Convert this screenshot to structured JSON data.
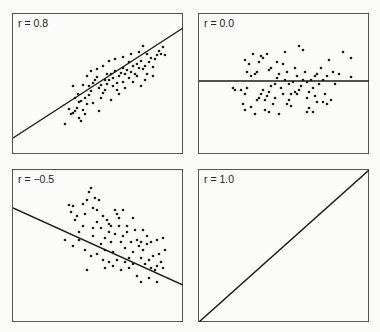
{
  "chart_data": [
    {
      "type": "scatter",
      "title": "r = 0.8",
      "r": 0.8,
      "regression_line": {
        "x1": 0,
        "y1": 124,
        "x2": 170,
        "y2": 14
      },
      "panel": {
        "x": 12,
        "y": 13,
        "w": 170,
        "h": 140
      },
      "points": [
        [
          52,
          110
        ],
        [
          56,
          95
        ],
        [
          58,
          100
        ],
        [
          60,
          99
        ],
        [
          62,
          97
        ],
        [
          64,
          94
        ],
        [
          66,
          104
        ],
        [
          68,
          107
        ],
        [
          70,
          96
        ],
        [
          62,
          84
        ],
        [
          65,
          80
        ],
        [
          68,
          87
        ],
        [
          70,
          71
        ],
        [
          72,
          84
        ],
        [
          74,
          90
        ],
        [
          76,
          72
        ],
        [
          78,
          77
        ],
        [
          80,
          69
        ],
        [
          82,
          66
        ],
        [
          84,
          63
        ],
        [
          86,
          74
        ],
        [
          88,
          71
        ],
        [
          90,
          79
        ],
        [
          92,
          76
        ],
        [
          94,
          70
        ],
        [
          96,
          66
        ],
        [
          98,
          60
        ],
        [
          100,
          64
        ],
        [
          102,
          57
        ],
        [
          104,
          69
        ],
        [
          106,
          62
        ],
        [
          108,
          59
        ],
        [
          110,
          54
        ],
        [
          112,
          60
        ],
        [
          114,
          56
        ],
        [
          116,
          64
        ],
        [
          118,
          58
        ],
        [
          120,
          52
        ],
        [
          122,
          60
        ],
        [
          124,
          50
        ],
        [
          126,
          54
        ],
        [
          128,
          47
        ],
        [
          130,
          55
        ],
        [
          132,
          52
        ],
        [
          134,
          60
        ],
        [
          136,
          48
        ],
        [
          138,
          44
        ],
        [
          140,
          53
        ],
        [
          142,
          45
        ],
        [
          144,
          41
        ],
        [
          146,
          37
        ],
        [
          148,
          40
        ],
        [
          150,
          33
        ],
        [
          152,
          41
        ],
        [
          126,
          38
        ],
        [
          130,
          32
        ],
        [
          134,
          40
        ],
        [
          118,
          40
        ],
        [
          110,
          43
        ],
        [
          102,
          45
        ],
        [
          96,
          47
        ],
        [
          90,
          52
        ],
        [
          84,
          55
        ],
        [
          78,
          57
        ],
        [
          74,
          62
        ],
        [
          92,
          66
        ],
        [
          100,
          72
        ],
        [
          106,
          80
        ],
        [
          112,
          74
        ],
        [
          120,
          68
        ],
        [
          88,
          84
        ],
        [
          80,
          89
        ],
        [
          86,
          97
        ],
        [
          76,
          81
        ],
        [
          60,
          72
        ],
        [
          94,
          60
        ],
        [
          116,
          48
        ],
        [
          124,
          62
        ],
        [
          132,
          66
        ],
        [
          140,
          62
        ],
        [
          98,
          86
        ],
        [
          104,
          76
        ],
        [
          72,
          100
        ],
        [
          66,
          88
        ],
        [
          110,
          68
        ],
        [
          128,
          72
        ]
      ]
    },
    {
      "type": "scatter",
      "title": "r = 0.0",
      "r": 0.0,
      "regression_line": {
        "x1": 0,
        "y1": 67,
        "x2": 170,
        "y2": 67
      },
      "panel": {
        "x": 198,
        "y": 13,
        "w": 170,
        "h": 140
      },
      "points": [
        [
          34,
          74
        ],
        [
          36,
          76
        ],
        [
          42,
          76
        ],
        [
          46,
          80
        ],
        [
          48,
          74
        ],
        [
          44,
          90
        ],
        [
          46,
          96
        ],
        [
          52,
          93
        ],
        [
          56,
          100
        ],
        [
          58,
          86
        ],
        [
          60,
          84
        ],
        [
          62,
          80
        ],
        [
          64,
          76
        ],
        [
          66,
          86
        ],
        [
          68,
          82
        ],
        [
          70,
          78
        ],
        [
          72,
          72
        ],
        [
          74,
          90
        ],
        [
          76,
          70
        ],
        [
          78,
          64
        ],
        [
          80,
          60
        ],
        [
          82,
          74
        ],
        [
          84,
          80
        ],
        [
          86,
          66
        ],
        [
          88,
          58
        ],
        [
          90,
          86
        ],
        [
          92,
          92
        ],
        [
          94,
          68
        ],
        [
          96,
          54
        ],
        [
          98,
          62
        ],
        [
          100,
          76
        ],
        [
          102,
          72
        ],
        [
          104,
          66
        ],
        [
          106,
          58
        ],
        [
          108,
          84
        ],
        [
          110,
          78
        ],
        [
          112,
          66
        ],
        [
          114,
          74
        ],
        [
          116,
          82
        ],
        [
          118,
          60
        ],
        [
          120,
          70
        ],
        [
          122,
          54
        ],
        [
          124,
          66
        ],
        [
          126,
          80
        ],
        [
          128,
          62
        ],
        [
          130,
          46
        ],
        [
          132,
          86
        ],
        [
          134,
          58
        ],
        [
          136,
          70
        ],
        [
          140,
          60
        ],
        [
          144,
          38
        ],
        [
          152,
          44
        ],
        [
          152,
          63
        ],
        [
          100,
          32
        ],
        [
          104,
          36
        ],
        [
          86,
          38
        ],
        [
          84,
          50
        ],
        [
          78,
          48
        ],
        [
          72,
          54
        ],
        [
          68,
          40
        ],
        [
          64,
          44
        ],
        [
          60,
          48
        ],
        [
          58,
          58
        ],
        [
          56,
          60
        ],
        [
          52,
          62
        ],
        [
          48,
          58
        ],
        [
          50,
          50
        ],
        [
          46,
          46
        ],
        [
          54,
          40
        ],
        [
          62,
          42
        ],
        [
          70,
          56
        ],
        [
          88,
          90
        ],
        [
          92,
          80
        ],
        [
          96,
          78
        ],
        [
          108,
          98
        ],
        [
          110,
          94
        ],
        [
          114,
          98
        ],
        [
          80,
          100
        ],
        [
          70,
          98
        ],
        [
          66,
          96
        ],
        [
          118,
          88
        ],
        [
          124,
          88
        ],
        [
          128,
          90
        ],
        [
          108,
          68
        ],
        [
          116,
          62
        ],
        [
          90,
          70
        ],
        [
          98,
          80
        ],
        [
          76,
          84
        ]
      ]
    },
    {
      "type": "scatter",
      "title": "r = −0.5",
      "r": -0.5,
      "regression_line": {
        "x1": 0,
        "y1": 38,
        "x2": 170,
        "y2": 115
      },
      "panel": {
        "x": 12,
        "y": 169,
        "w": 170,
        "h": 152
      },
      "points": [
        [
          56,
          35
        ],
        [
          58,
          42
        ],
        [
          60,
          36
        ],
        [
          62,
          50
        ],
        [
          64,
          46
        ],
        [
          66,
          62
        ],
        [
          70,
          34
        ],
        [
          72,
          44
        ],
        [
          74,
          30
        ],
        [
          76,
          22
        ],
        [
          78,
          18
        ],
        [
          80,
          38
        ],
        [
          82,
          28
        ],
        [
          84,
          40
        ],
        [
          86,
          30
        ],
        [
          88,
          58
        ],
        [
          90,
          46
        ],
        [
          92,
          68
        ],
        [
          94,
          50
        ],
        [
          96,
          62
        ],
        [
          98,
          72
        ],
        [
          100,
          82
        ],
        [
          102,
          64
        ],
        [
          104,
          44
        ],
        [
          106,
          48
        ],
        [
          108,
          72
        ],
        [
          110,
          66
        ],
        [
          112,
          78
        ],
        [
          114,
          62
        ],
        [
          116,
          88
        ],
        [
          118,
          72
        ],
        [
          120,
          82
        ],
        [
          122,
          60
        ],
        [
          124,
          70
        ],
        [
          126,
          76
        ],
        [
          128,
          88
        ],
        [
          130,
          80
        ],
        [
          132,
          94
        ],
        [
          134,
          74
        ],
        [
          136,
          90
        ],
        [
          138,
          98
        ],
        [
          140,
          86
        ],
        [
          142,
          100
        ],
        [
          144,
          96
        ],
        [
          146,
          84
        ],
        [
          148,
          92
        ],
        [
          150,
          98
        ],
        [
          152,
          80
        ],
        [
          124,
          106
        ],
        [
          128,
          112
        ],
        [
          136,
          108
        ],
        [
          144,
          112
        ],
        [
          116,
          98
        ],
        [
          112,
          92
        ],
        [
          104,
          90
        ],
        [
          96,
          92
        ],
        [
          90,
          90
        ],
        [
          84,
          84
        ],
        [
          78,
          86
        ],
        [
          72,
          80
        ],
        [
          66,
          70
        ],
        [
          60,
          76
        ],
        [
          52,
          70
        ],
        [
          74,
          100
        ],
        [
          92,
          98
        ],
        [
          100,
          96
        ],
        [
          108,
          100
        ],
        [
          120,
          94
        ],
        [
          98,
          56
        ],
        [
          106,
          56
        ],
        [
          84,
          52
        ],
        [
          80,
          58
        ],
        [
          70,
          56
        ],
        [
          114,
          56
        ],
        [
          120,
          48
        ],
        [
          110,
          40
        ],
        [
          102,
          40
        ],
        [
          96,
          54
        ],
        [
          88,
          74
        ],
        [
          80,
          66
        ],
        [
          130,
          60
        ],
        [
          134,
          66
        ],
        [
          138,
          72
        ],
        [
          144,
          70
        ],
        [
          150,
          68
        ],
        [
          128,
          72
        ],
        [
          92,
          80
        ]
      ]
    },
    {
      "type": "scatter",
      "title": "r = 1.0",
      "r": 1.0,
      "regression_line": {
        "x1": 0,
        "y1": 152,
        "x2": 170,
        "y2": 0
      },
      "panel": {
        "x": 198,
        "y": 169,
        "w": 170,
        "h": 152
      },
      "points": []
    }
  ]
}
